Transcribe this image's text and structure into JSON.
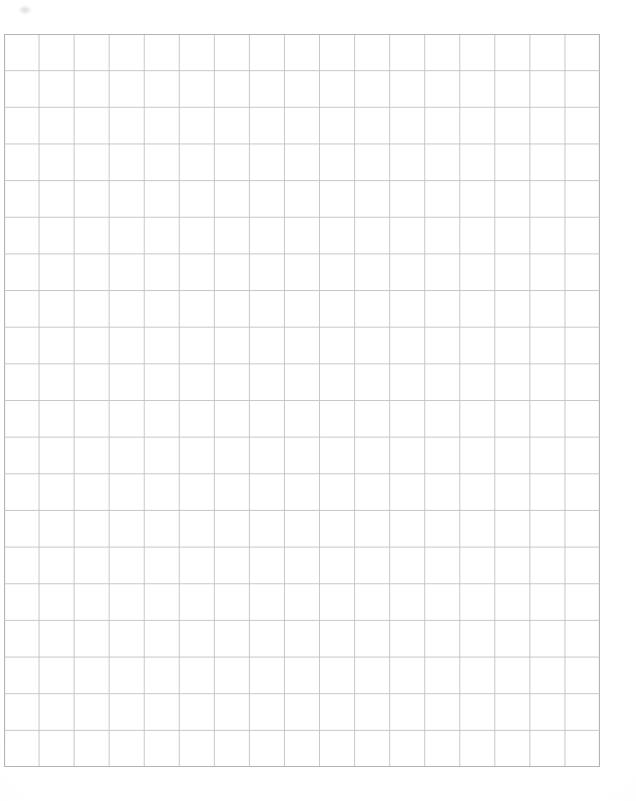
{
  "document": {
    "title": "Graph Paper Grid Sheet",
    "kind": "grid-paper-scan",
    "page_width": 636,
    "page_height": 801,
    "background_color": "#ffffff"
  },
  "grid": {
    "columns": 17,
    "rows": 20,
    "left": 4,
    "top": 34,
    "width": 596,
    "height": 733,
    "cell_width": 35.06,
    "cell_height": 36.65,
    "line_color": "#c2c2c2",
    "border_color": "#b4b4b4",
    "line_width": 0.9,
    "border_width": 1.1,
    "label": "graph-paper-grid"
  },
  "artifacts": {
    "smudge_label": "scan-smudge",
    "smudge_color": "#bebebe"
  }
}
